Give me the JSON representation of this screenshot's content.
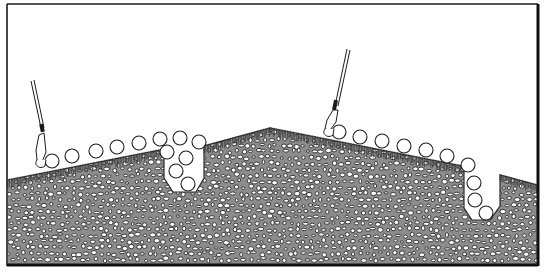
{
  "figure": {
    "colors": {
      "background": "#ffffff",
      "ink": "#1a1a1a",
      "soil_fill": "#8c8c8c",
      "pebble_fill": "#ffffff"
    },
    "elements": {
      "ground_profile": "ridge",
      "tools": [
        {
          "name": "dibber-tool-left",
          "icon": "planting-tool-icon"
        },
        {
          "name": "dibber-tool-right",
          "icon": "planting-tool-icon"
        }
      ],
      "furrows": [
        {
          "name": "furrow-left",
          "seed_count": 6
        },
        {
          "name": "furrow-right",
          "seed_count": 4
        }
      ],
      "surface_seed_groups": [
        {
          "name": "left-slope-seeds",
          "seed_count": 6
        },
        {
          "name": "right-slope-seeds",
          "seed_count": 6
        }
      ]
    }
  }
}
